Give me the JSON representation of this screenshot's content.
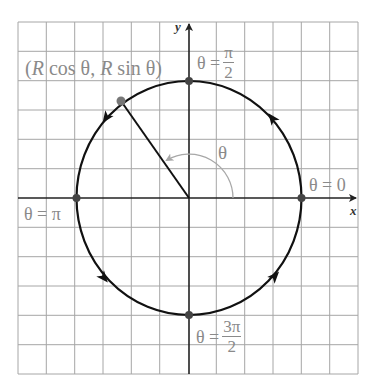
{
  "diagram": {
    "axes": {
      "x_label": "x",
      "y_label": "y"
    },
    "point_label": {
      "open": "(",
      "R1": "R",
      "cos": " cos θ, ",
      "R2": "R",
      "sin": " sin θ)"
    },
    "angle_label": "θ",
    "labels": {
      "theta_0": "θ = 0",
      "theta_pi": "θ = π",
      "theta_pi_half_prefix": "θ =",
      "theta_pi_half_num": "π",
      "theta_pi_half_den": "2",
      "theta_3pi_half_prefix": "θ =",
      "theta_3pi_half_num": "3π",
      "theta_3pi_half_den": "2"
    },
    "colors": {
      "grid": "#a0a0a0",
      "curve": "#111111",
      "label": "#8a8a8a",
      "angle_arc": "#a8a8a8"
    },
    "geometry": {
      "grid_cells_x": 12,
      "grid_cells_y": 12,
      "circle_radius_cells": 4,
      "marked_points_deg": [
        0,
        90,
        180,
        270,
        125
      ],
      "direction": "counterclockwise"
    }
  }
}
